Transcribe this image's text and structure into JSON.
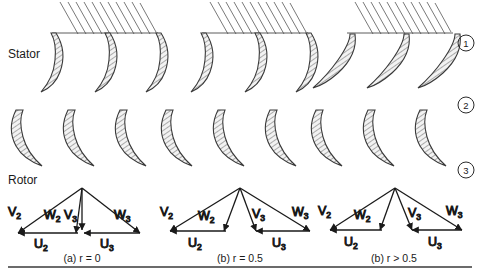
{
  "figure": {
    "background_color": "#ffffff",
    "line_color": "#1a1a1a",
    "blade_fill": "#e6e6e6",
    "hatch_color": "#555555",
    "row_labels": {
      "stator": "Stator",
      "rotor": "Rotor"
    },
    "station_markers": [
      {
        "label": "1"
      },
      {
        "label": "2"
      },
      {
        "label": "3"
      }
    ],
    "captions": [
      {
        "label": "(a) r = 0"
      },
      {
        "label": "(b) r = 0.5"
      },
      {
        "label": "(b) r > 0.5"
      }
    ],
    "velocity_labels": {
      "v2": {
        "base": "V",
        "sub": "2"
      },
      "w2": {
        "base": "W",
        "sub": "2"
      },
      "v3": {
        "base": "V",
        "sub": "3"
      },
      "w3": {
        "base": "W",
        "sub": "3"
      },
      "u2": {
        "base": "U",
        "sub": "2"
      },
      "u3": {
        "base": "U",
        "sub": "3"
      }
    },
    "groups": [
      {
        "name": "reaction-zero",
        "caption": "(a) r = 0",
        "stator_blade_style": "steep-curved",
        "rotor_blade_style": "crescent-left",
        "triangle_shape": "impulse-symmetric-vertical-v3"
      },
      {
        "name": "reaction-half",
        "caption": "(b) r = 0.5",
        "stator_blade_style": "steep-curved",
        "rotor_blade_style": "crescent-left",
        "triangle_shape": "mirror-symmetric"
      },
      {
        "name": "reaction-above-half",
        "caption": "(b) r > 0.5",
        "stator_blade_style": "shallow-curved",
        "rotor_blade_style": "crescent-left",
        "triangle_shape": "mirror-symmetric-wide"
      }
    ]
  }
}
